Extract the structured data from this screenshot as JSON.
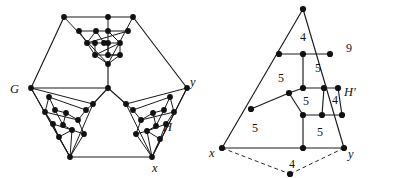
{
  "figure": {
    "caption_labels": {
      "left_graph_label": "G",
      "left_graph_sub_label": "H",
      "left_vertex_x": "x",
      "left_vertex_y": "y",
      "right_graph_label": "H'",
      "right_vertex_x": "x",
      "right_vertex_y": "y",
      "outer_face_label": "9"
    },
    "left_panel": {
      "name": "planar-graph-G-with-H",
      "outer_hexagon": [
        [
          64,
          17
        ],
        [
          133,
          17
        ],
        [
          187,
          88
        ],
        [
          152,
          157
        ],
        [
          70,
          157
        ],
        [
          31,
          88
        ]
      ],
      "labels": [
        {
          "text": "G",
          "x": 14,
          "y": 92
        },
        {
          "text": "y",
          "x": 191,
          "y": 86
        },
        {
          "text": "H",
          "x": 167,
          "y": 129
        },
        {
          "text": "x",
          "x": 155,
          "y": 171
        }
      ],
      "center_vertex": [
        108,
        88
      ],
      "vertex_count": 48
    },
    "right_panel": {
      "name": "planar-triangulation-H-prime",
      "outer_triangle": [
        [
          303,
          9
        ],
        [
          222,
          148
        ],
        [
          344,
          148
        ]
      ],
      "apex_vertex": [
        303,
        9
      ],
      "bottom_vertex": [
        290,
        174
      ],
      "labels": [
        {
          "text": "x",
          "x": 212,
          "y": 154
        },
        {
          "text": "y",
          "x": 350,
          "y": 155
        },
        {
          "text": "H'",
          "x": 350,
          "y": 92
        },
        {
          "text": "9",
          "x": 349,
          "y": 48
        }
      ],
      "face_numbers": [
        {
          "value": "4",
          "x": 303,
          "y": 37
        },
        {
          "value": "5",
          "x": 318,
          "y": 66
        },
        {
          "value": "5",
          "x": 281,
          "y": 80
        },
        {
          "value": "5",
          "x": 306,
          "y": 101
        },
        {
          "value": "4",
          "x": 337,
          "y": 102
        },
        {
          "value": "5",
          "x": 256,
          "y": 127
        },
        {
          "value": "5",
          "x": 318,
          "y": 131
        },
        {
          "value": "4",
          "x": 290,
          "y": 163
        }
      ]
    },
    "colors": {
      "stroke": "#1a1a1a",
      "node": "#111111",
      "background": "#ffffff",
      "dashed": "#2a2a2a"
    }
  }
}
